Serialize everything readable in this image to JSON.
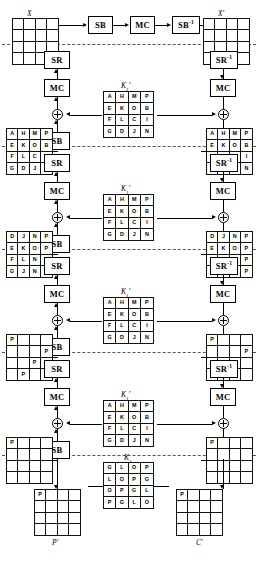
{
  "diagram": {
    "title_smudge": "",
    "operations": {
      "sb": "SB",
      "mc": "MC",
      "sr": "SR",
      "sb_inv": "SB",
      "sr_inv": "SR",
      "inv_exp": "-1"
    },
    "labels": {
      "x": "X",
      "x_prime": "X'",
      "p_prime": "P'",
      "c_prime": "C'",
      "key_prime": "K",
      "key_prime_sub": "1",
      "key_prime_mark": "'",
      "key_last": "K",
      "key_last_sub": "1"
    },
    "top_path": [
      {
        "name": "sb",
        "label": "SB"
      },
      {
        "name": "mc",
        "label": "MC"
      },
      {
        "name": "sb-inv",
        "label": "SB",
        "sup": "-1"
      }
    ],
    "left_column_ops": [
      {
        "label": "SR"
      },
      {
        "label": "MC"
      },
      {
        "label": "SB"
      },
      {
        "label": "SR"
      },
      {
        "label": "MC"
      },
      {
        "label": "SB"
      },
      {
        "label": "SR"
      },
      {
        "label": "MC"
      },
      {
        "label": "SB"
      },
      {
        "label": "SR"
      },
      {
        "label": "MC"
      },
      {
        "label": "SB"
      }
    ],
    "right_column_ops": [
      {
        "label": "SR",
        "sup": "-1"
      },
      {
        "label": "MC"
      },
      {
        "label": "SB",
        "sup": "-1"
      },
      {
        "label": "SR",
        "sup": "-1"
      },
      {
        "label": "MC"
      },
      {
        "label": "SB",
        "sup": "-1"
      },
      {
        "label": "SR",
        "sup": "-1"
      },
      {
        "label": "MC"
      },
      {
        "label": "SB",
        "sup": "-1"
      },
      {
        "label": "SR",
        "sup": "-1"
      },
      {
        "label": "MC"
      },
      {
        "label": "SB",
        "sup": "-1"
      }
    ],
    "matrices": {
      "x_top_left": [
        "",
        "",
        "",
        "",
        "",
        "",
        "",
        "",
        "",
        "",
        "",
        "",
        "",
        "",
        "",
        ""
      ],
      "x_top_right": [
        "",
        "",
        "",
        "",
        "",
        "",
        "",
        "",
        "",
        "",
        "",
        "",
        "",
        "",
        "",
        ""
      ],
      "state_l1": [
        "A",
        "H",
        "M",
        "P",
        "E",
        "K",
        "O",
        "B",
        "F",
        "L",
        "C",
        "I",
        "G",
        "D",
        "J",
        "N"
      ],
      "state_r1": [
        "A",
        "H",
        "M",
        "P",
        "E",
        "K",
        "O",
        "B",
        "F",
        "L",
        "C",
        "I",
        "G",
        "D",
        "J",
        "N"
      ],
      "state_l2": [
        "D",
        "J",
        "N",
        "P",
        "E",
        "K",
        "O",
        "P",
        "F",
        "L",
        "N",
        "P",
        "G",
        "J",
        "N",
        "P"
      ],
      "state_r2": [
        "D",
        "J",
        "N",
        "P",
        "E",
        "K",
        "O",
        "P",
        "F",
        "L",
        "N",
        "P",
        "G",
        "J",
        "N",
        "P"
      ],
      "state_l3": [
        "P",
        "",
        "",
        "",
        "",
        "",
        "",
        "P",
        "",
        "",
        "P",
        "",
        "",
        "P",
        "",
        ""
      ],
      "state_r3": [
        "P",
        "",
        "",
        "",
        "",
        "",
        "",
        "P",
        "",
        "",
        "P",
        "",
        "",
        "P",
        "",
        ""
      ],
      "state_l4": [
        "P",
        "",
        "",
        "",
        "",
        "",
        "",
        "",
        "",
        "",
        "",
        "",
        "",
        "",
        "",
        ""
      ],
      "state_r4": [
        "P",
        "",
        "",
        "",
        "",
        "",
        "",
        "",
        "",
        "",
        "",
        "",
        "",
        "",
        "",
        ""
      ],
      "p_prime": [
        "P",
        "",
        "",
        "",
        "",
        "",
        "",
        "",
        "",
        "",
        "",
        "",
        "",
        "",
        "",
        ""
      ],
      "c_prime": [
        "P",
        "",
        "",
        "",
        "",
        "",
        "",
        "",
        "",
        "",
        "",
        "",
        "",
        "",
        "",
        ""
      ],
      "key1": [
        "A",
        "H",
        "M",
        "P",
        "E",
        "K",
        "O",
        "B",
        "F",
        "L",
        "C",
        "I",
        "G",
        "D",
        "J",
        "N"
      ],
      "key2": [
        "A",
        "H",
        "M",
        "P",
        "E",
        "K",
        "O",
        "B",
        "F",
        "L",
        "C",
        "I",
        "G",
        "D",
        "J",
        "N"
      ],
      "key3": [
        "A",
        "H",
        "M",
        "P",
        "E",
        "K",
        "O",
        "B",
        "F",
        "L",
        "C",
        "I",
        "G",
        "D",
        "J",
        "N"
      ],
      "key4": [
        "A",
        "H",
        "M",
        "P",
        "E",
        "K",
        "O",
        "B",
        "F",
        "L",
        "C",
        "I",
        "G",
        "D",
        "J",
        "N"
      ],
      "key5": [
        "G",
        "L",
        "O",
        "P",
        "L",
        "O",
        "P",
        "G",
        "O",
        "P",
        "G",
        "L",
        "P",
        "G",
        "L",
        "O"
      ]
    },
    "key_captions": [
      "K",
      "K",
      "K",
      "K",
      "K"
    ],
    "key_subs": [
      "1",
      "1",
      "1",
      "1",
      "1"
    ],
    "colors": {
      "line": "#000000",
      "dash": "#555555",
      "background": "#ffffff"
    }
  }
}
